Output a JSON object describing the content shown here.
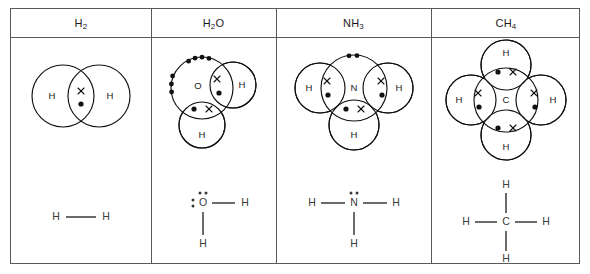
{
  "figure": {
    "kind": "chemistry-bonding-table",
    "background_color": "#ffffff",
    "line_color": "#111111",
    "border_color": "#5a5a5a",
    "lewis_color": "#3a3a3a"
  },
  "table": {
    "columns": [
      {
        "id": "h2",
        "header": {
          "base1": "H",
          "sub1": "2",
          "base2": "",
          "sub2": ""
        },
        "header_text": "H2",
        "dot_cross": {
          "central_atom": "H",
          "outer_atoms": [
            "H"
          ],
          "lone_pairs": 0,
          "bonding_pairs": 1,
          "shared_electron_symbols": [
            "cross",
            "dot"
          ]
        },
        "lewis": {
          "central_atom": "H",
          "terminal_atoms": [
            "H"
          ],
          "lone_pair_dots": 0,
          "bonds": 1
        }
      },
      {
        "id": "h2o",
        "header": {
          "base1": "H",
          "sub1": "2",
          "base2": "O",
          "sub2": ""
        },
        "header_text": "H2O",
        "dot_cross": {
          "central_atom": "O",
          "outer_atoms": [
            "H",
            "H"
          ],
          "lone_pairs": 2,
          "bonding_pairs": 2,
          "shared_electron_symbols": [
            "cross",
            "dot"
          ]
        },
        "lewis": {
          "central_atom": "O",
          "terminal_atoms": [
            "H",
            "H"
          ],
          "lone_pair_dots": 4,
          "bonds": 2
        }
      },
      {
        "id": "nh3",
        "header": {
          "base1": "N",
          "sub1": "",
          "base2": "H",
          "sub2": "3"
        },
        "header_text": "NH3",
        "dot_cross": {
          "central_atom": "N",
          "outer_atoms": [
            "H",
            "H",
            "H"
          ],
          "lone_pairs": 1,
          "bonding_pairs": 3,
          "shared_electron_symbols": [
            "cross",
            "dot"
          ]
        },
        "lewis": {
          "central_atom": "N",
          "terminal_atoms": [
            "H",
            "H",
            "H"
          ],
          "lone_pair_dots": 2,
          "bonds": 3
        }
      },
      {
        "id": "ch4",
        "header": {
          "base1": "C",
          "sub1": "",
          "base2": "H",
          "sub2": "4"
        },
        "header_text": "CH4",
        "dot_cross": {
          "central_atom": "C",
          "outer_atoms": [
            "H",
            "H",
            "H",
            "H"
          ],
          "lone_pairs": 0,
          "bonding_pairs": 4,
          "shared_electron_symbols": [
            "cross",
            "dot"
          ]
        },
        "lewis": {
          "central_atom": "C",
          "terminal_atoms": [
            "H",
            "H",
            "H",
            "H"
          ],
          "lone_pair_dots": 0,
          "bonds": 4
        }
      }
    ]
  },
  "atom_labels": {
    "h": "H",
    "o": "O",
    "n": "N",
    "c": "C"
  }
}
